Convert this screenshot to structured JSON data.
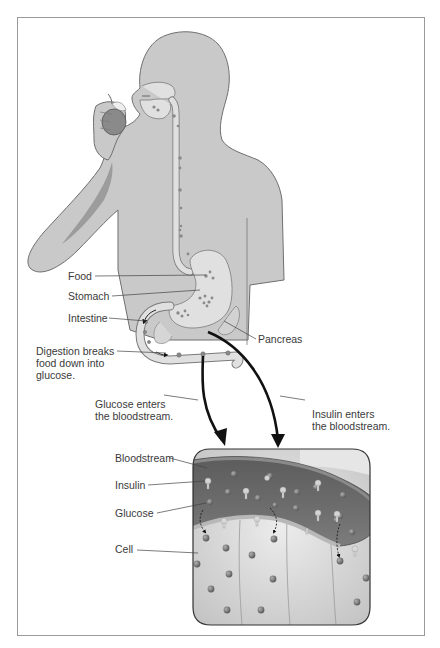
{
  "diagram": {
    "colors": {
      "body_fill": "#c9c9c9",
      "body_outline": "#6f6f6f",
      "gut_fill": "#e0e0e0",
      "vessel_fill": "#6a6a6a",
      "cell_fill": "#d8d8d8",
      "particle": "#7a7a7a",
      "insulin": "#d4d4d4",
      "text": "#3a3a3a",
      "frame": "#9a9a9a"
    },
    "body_labels": {
      "food": "Food",
      "stomach": "Stomach",
      "intestine": "Intestine",
      "pancreas": "Pancreas",
      "digestion": "Digestion breaks\nfood down into\nglucose."
    },
    "flow_labels": {
      "glucose_enters": "Glucose enters\nthe bloodstream.",
      "insulin_enters": "Insulin enters\nthe bloodstream."
    },
    "inset_labels": {
      "bloodstream": "Bloodstream",
      "insulin": "Insulin",
      "glucose": "Glucose",
      "cell": "Cell"
    }
  }
}
